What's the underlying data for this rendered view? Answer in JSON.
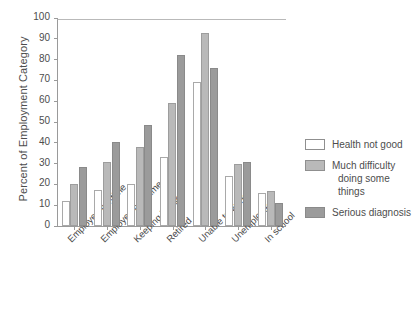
{
  "chart_data": {
    "type": "bar",
    "title": "",
    "subtitle": "",
    "xlabel": "",
    "ylabel": "Percent of Employment Category",
    "ylim": [
      0,
      100
    ],
    "ytick_step": 10,
    "yticks": [
      0,
      10,
      20,
      30,
      40,
      50,
      60,
      70,
      80,
      90,
      100
    ],
    "grid": false,
    "legend_position": "right",
    "categories": [
      "Employed full-time",
      "Employed part-time",
      "Keeping house",
      "Retired",
      "Unable to work",
      "Unemployed",
      "In school"
    ],
    "series": [
      {
        "name": "Health not good",
        "color": "#ffffff",
        "values": [
          12,
          17.5,
          20,
          33,
          69,
          24,
          16
        ]
      },
      {
        "name": "Much difficulty doing some things",
        "color": "#b9b9b9",
        "values": [
          20,
          31,
          38,
          59,
          93,
          30,
          17
        ]
      },
      {
        "name": "Serious diagnosis",
        "color": "#9b9b9b",
        "values": [
          28.5,
          40.5,
          48.5,
          82,
          76,
          31,
          11
        ]
      }
    ],
    "legend_entries": [
      {
        "label": "Health not good",
        "label_line2": ""
      },
      {
        "label": "Much difficulty",
        "label_line2": "doing some things"
      },
      {
        "label": "Serious diagnosis",
        "label_line2": ""
      }
    ]
  },
  "colors": {
    "series_1": "#ffffff",
    "series_2": "#b9b9b9",
    "series_3": "#9b9b9b",
    "axis": "#9a9a9a",
    "text": "#4d4d4d",
    "background": "#ffffff"
  }
}
